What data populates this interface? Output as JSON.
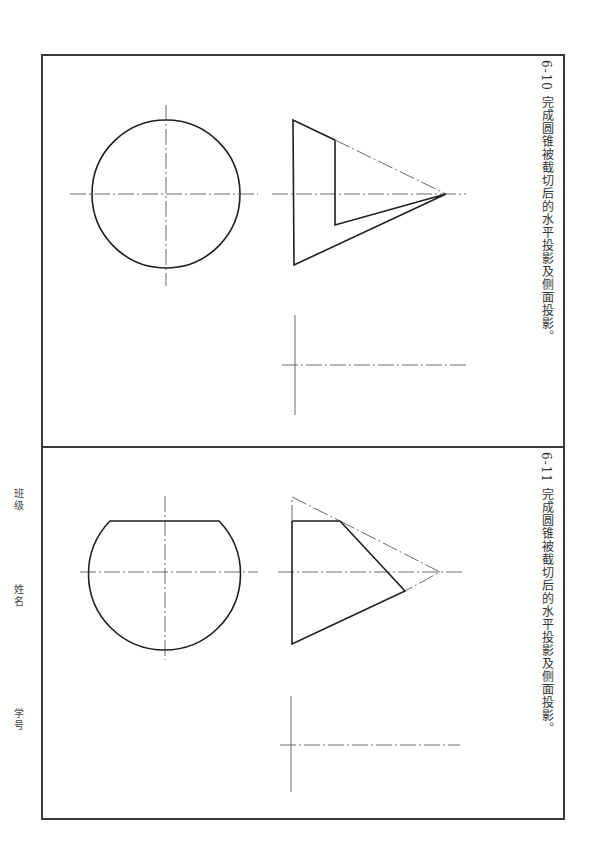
{
  "worksheet": {
    "exercises": [
      {
        "number": "6-10",
        "instruction": "完成圆锥被截切后的水平投影及侧面投影。",
        "full_title": "6-10  完成圆锥被截切后的水平投影及侧面投影。"
      },
      {
        "number": "6-11",
        "instruction": "完成圆锥被截切后的水平投影及侧面投影。",
        "full_title": "6-11  完成圆锥被截切后的水平投影及侧面投影。"
      }
    ],
    "student_fields": {
      "class_label": "班级",
      "name_label": "姓名",
      "id_label": "学号"
    }
  }
}
